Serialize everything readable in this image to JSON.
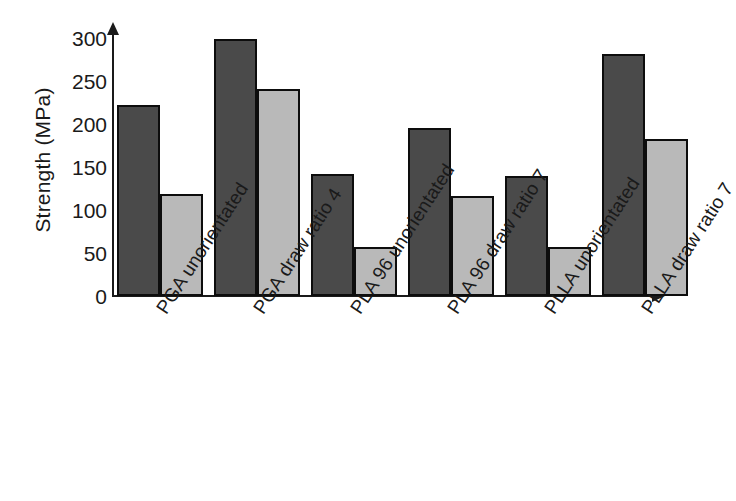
{
  "chart_data": {
    "type": "bar",
    "title": "",
    "subtitle": "",
    "xlabel": "",
    "ylabel": "Strength (MPa)",
    "ylim": [
      0,
      300
    ],
    "ytick_step": 50,
    "yticks": [
      "300",
      "250",
      "200",
      "150",
      "100",
      "50",
      "0"
    ],
    "grid": false,
    "legend": "none",
    "categories": [
      "PGA unorientated",
      "PGA draw ratio 4",
      "PLA 96 unorientated",
      "PLA 96 draw ratio 7",
      "PLLA unorientated",
      "PLLA draw ratio 7"
    ],
    "series": [
      {
        "name": "dark-series",
        "color": "#4a4a4a",
        "values": [
          217,
          292,
          139,
          191,
          136,
          275
        ]
      },
      {
        "name": "light-series",
        "color": "#b9b9b9",
        "values": [
          116,
          235,
          56,
          114,
          56,
          178
        ]
      }
    ]
  },
  "axes": {
    "y_axis_title": "Strength (MPa)",
    "y_arrow_icon": "axis-arrow-up-icon",
    "x_arrow_icon": "axis-arrow-right-icon"
  }
}
